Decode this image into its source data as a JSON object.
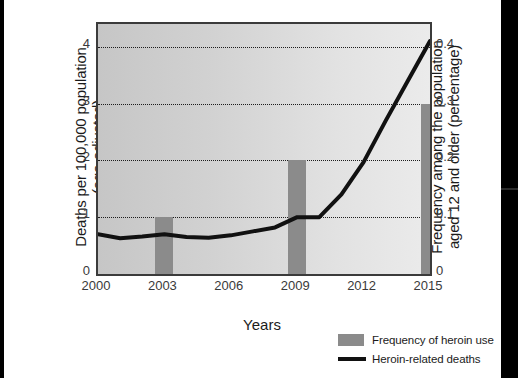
{
  "chart_data": {
    "type": "line",
    "title": "",
    "xlabel": "Years",
    "ylabel": "Deaths per 100,000 population (age-adjusted)",
    "ylabel_line1": "Deaths per 100,000 population",
    "ylabel_line2": "(age-adjusted)",
    "y2label": "Frequency among the population aged 12 and older (percentage)",
    "y2label_line1": "Frequency among the population",
    "y2label_line2": "aged 12 and older (percentage)",
    "xlim": [
      2000,
      2015
    ],
    "ylim": [
      0,
      4.4
    ],
    "y2lim": [
      0,
      0.44
    ],
    "grid": true,
    "legend_position": "bottom-right",
    "xticks": [
      "2000",
      "2003",
      "2006",
      "2009",
      "2012",
      "2015"
    ],
    "xtick_values": [
      2000,
      2003,
      2006,
      2009,
      2012,
      2015
    ],
    "yticks_left": [
      "0",
      "1",
      "2",
      "3",
      "4"
    ],
    "ytick_left_values": [
      0,
      1,
      2,
      3,
      4
    ],
    "yticks_right": [
      "0",
      "0.1",
      "0.2",
      "0.3",
      "0.4"
    ],
    "ytick_right_values": [
      0,
      0.1,
      0.2,
      0.3,
      0.4
    ],
    "series": [
      {
        "name": "Frequency of heroin use",
        "type": "bar",
        "axis": "right",
        "color": "#8b8b8b",
        "categories": [
          2003,
          2009,
          2015
        ],
        "values": [
          0.1,
          0.2,
          0.3
        ]
      },
      {
        "name": "Heroin-related deaths",
        "type": "line",
        "axis": "left",
        "color": "#111111",
        "x": [
          2000,
          2001,
          2002,
          2003,
          2004,
          2005,
          2006,
          2007,
          2008,
          2009,
          2010,
          2011,
          2012,
          2013,
          2014,
          2015
        ],
        "values": [
          0.7,
          0.63,
          0.66,
          0.7,
          0.65,
          0.64,
          0.68,
          0.75,
          0.82,
          1.0,
          1.0,
          1.4,
          1.97,
          2.7,
          3.4,
          4.1
        ]
      }
    ],
    "legend": [
      {
        "label": "Frequency of heroin use",
        "marker": "bar",
        "color": "#8b8b8b"
      },
      {
        "label": "Heroin-related deaths",
        "marker": "line",
        "color": "#111111"
      }
    ]
  }
}
